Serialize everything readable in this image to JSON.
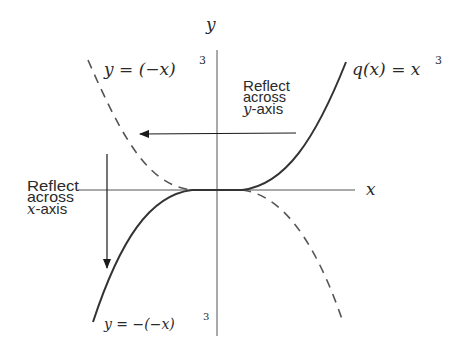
{
  "figure": {
    "axes": {
      "x_label": "x",
      "y_label": "y"
    },
    "curves": [
      {
        "id": "original",
        "label_fn": "q(x) = x",
        "label_exp": "3",
        "style": "solid",
        "formula": "q(x)=x^3"
      },
      {
        "id": "reflect-y",
        "label_lhs": "y = (−x)",
        "label_exp": "3",
        "style": "dashed",
        "formula": "y=(-x)^3"
      },
      {
        "id": "reflect-xy",
        "label_lhs": "y = −(−x)",
        "label_exp": "3",
        "style": "solid",
        "formula": "y=-(-x)^3"
      }
    ],
    "annotations": {
      "reflect_y": {
        "line1": "Reflect",
        "line2": "across",
        "axis_var": "y",
        "axis_suffix": "-axis"
      },
      "reflect_x": {
        "line1": "Reflect",
        "line2": "across",
        "axis_var": "x",
        "axis_suffix": "-axis"
      }
    },
    "colors": {
      "ink": "#2a2a2a",
      "curve": "#444444",
      "axis": "#555555"
    }
  }
}
